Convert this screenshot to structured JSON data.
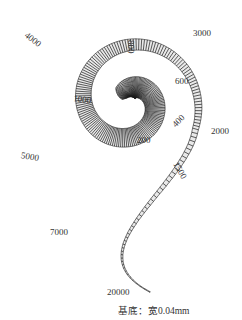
{
  "diagram": {
    "labels": [
      {
        "id": "f4000",
        "text": "4000",
        "x": 29,
        "y": 30,
        "rot": 38
      },
      {
        "id": "f800",
        "text": "800",
        "x": 136,
        "y": 40,
        "rot": 90
      },
      {
        "id": "f3000",
        "text": "3000",
        "x": 193,
        "y": 28,
        "rot": 0
      },
      {
        "id": "f600",
        "text": "600",
        "x": 175,
        "y": 76,
        "rot": 0
      },
      {
        "id": "f1000",
        "text": "1000",
        "x": 74,
        "y": 93,
        "rot": 8
      },
      {
        "id": "f400",
        "text": "400",
        "x": 170,
        "y": 122,
        "rot": -45
      },
      {
        "id": "f2000",
        "text": "2000",
        "x": 211,
        "y": 126,
        "rot": 0
      },
      {
        "id": "f200",
        "text": "200",
        "x": 137,
        "y": 135,
        "rot": 0
      },
      {
        "id": "f5000",
        "text": "5000",
        "x": 22,
        "y": 150,
        "rot": 10
      },
      {
        "id": "f1500",
        "text": "1500",
        "x": 180,
        "y": 160,
        "rot": 60
      },
      {
        "id": "f7000",
        "text": "7000",
        "x": 50,
        "y": 227,
        "rot": 0
      },
      {
        "id": "f20000",
        "text": "20000",
        "x": 107,
        "y": 287,
        "rot": 0
      }
    ],
    "caption": "基底：宽0.04mm",
    "colors": {
      "stroke": "#1a1a1a",
      "background": "#ffffff",
      "text": "#333333"
    }
  }
}
